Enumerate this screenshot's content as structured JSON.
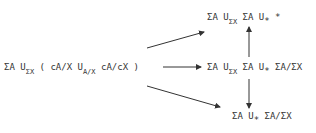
{
  "diagram": {
    "source": {
      "parts": [
        "ΣA U",
        "ΣX",
        " ( cA/X U",
        "A/X",
        " cA/cX )"
      ]
    },
    "top": {
      "parts": [
        "ΣA U",
        "ΣX",
        " ΣA U",
        "*",
        " *"
      ]
    },
    "middle": {
      "parts": [
        "ΣA U",
        "ΣX",
        " ΣA U",
        "*",
        " ΣA/ΣX"
      ]
    },
    "bottom": {
      "parts": [
        "ΣA  U",
        "*",
        " ΣA/ΣX"
      ]
    },
    "arrows": [
      {
        "from": "source",
        "to": "top",
        "direction": "diagonal-up"
      },
      {
        "from": "source",
        "to": "middle",
        "direction": "right"
      },
      {
        "from": "source",
        "to": "bottom",
        "direction": "diagonal-down"
      },
      {
        "from": "middle",
        "to": "top",
        "direction": "up"
      },
      {
        "from": "middle",
        "to": "bottom",
        "direction": "down"
      }
    ],
    "colors": {
      "ink": "#333333",
      "background": "#ffffff"
    }
  }
}
